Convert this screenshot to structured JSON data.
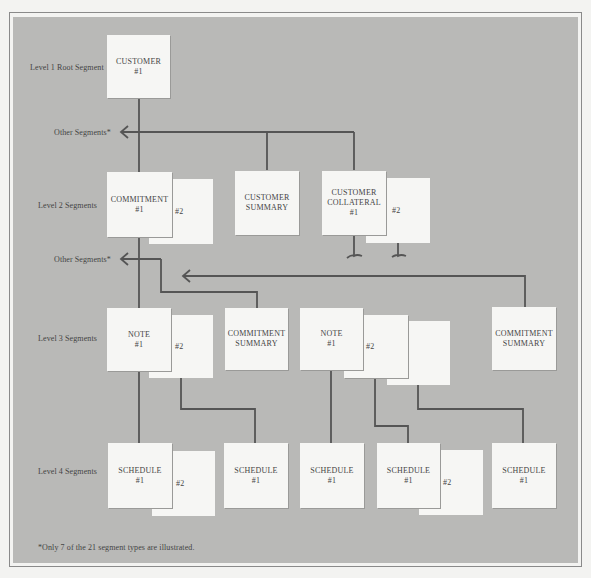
{
  "diagram": {
    "type": "hierarchical segment tree",
    "level_labels": [
      "Level 1 Root Segment",
      "Other Segments*",
      "Level 2 Segments",
      "Other Segments*",
      "Level 3 Segments",
      "Level 4 Segments"
    ],
    "level1": {
      "customer": {
        "name": "CUSTOMER",
        "num": "#1"
      }
    },
    "level2": {
      "commitment": {
        "name": "COMMITMENT",
        "num": "#1",
        "stack_num": "#2"
      },
      "customer_summary": {
        "name1": "CUSTOMER",
        "name2": "SUMMARY"
      },
      "customer_collateral": {
        "name1": "CUSTOMER",
        "name2": "COLLATERAL",
        "num": "#1",
        "stack_num": "#2"
      }
    },
    "level3": {
      "note_a": {
        "name": "NOTE",
        "num": "#1",
        "stack_num": "#2"
      },
      "commitment_summary_a": {
        "name1": "COMMITMENT",
        "name2": "SUMMARY"
      },
      "note_b": {
        "name": "NOTE",
        "num": "#1",
        "stack_num": "#2",
        "stack_num3": "#3"
      },
      "commitment_summary_b": {
        "name1": "COMMITMENT",
        "name2": "SUMMARY"
      }
    },
    "level4": {
      "schedule_a": {
        "name": "SCHEDULE",
        "num": "#1",
        "stack_num": "#2"
      },
      "schedule_b": {
        "name": "SCHEDULE",
        "num": "#1"
      },
      "schedule_c": {
        "name": "SCHEDULE",
        "num": "#1"
      },
      "schedule_d": {
        "name": "SCHEDULE",
        "num": "#1",
        "stack_num": "#2"
      },
      "schedule_e": {
        "name": "SCHEDULE",
        "num": "#1"
      }
    },
    "footnote": "*Only 7 of the 21 segment types are illustrated."
  },
  "colors": {
    "panel": "#b9b9b7",
    "box": "#f6f6f4",
    "line": "#555555"
  }
}
